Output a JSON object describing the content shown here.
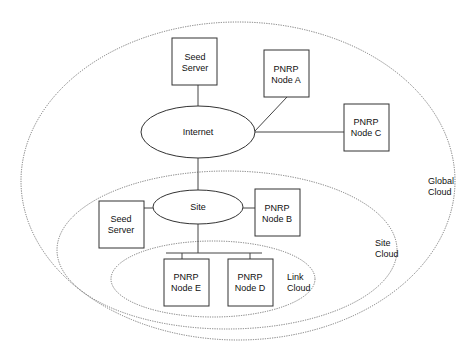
{
  "diagram": {
    "clouds": {
      "global": {
        "line1": "Global",
        "line2": "Cloud"
      },
      "site": {
        "line1": "Site",
        "line2": "Cloud"
      },
      "link": {
        "line1": "Link",
        "line2": "Cloud"
      }
    },
    "networks": {
      "internet": {
        "label": "Internet"
      },
      "site": {
        "label": "Site"
      }
    },
    "nodes": {
      "seed_server_global": {
        "line1": "Seed",
        "line2": "Server"
      },
      "pnrp_node_a": {
        "line1": "PNRP",
        "line2": "Node A"
      },
      "pnrp_node_c": {
        "line1": "PNRP",
        "line2": "Node C"
      },
      "seed_server_site": {
        "line1": "Seed",
        "line2": "Server"
      },
      "pnrp_node_b": {
        "line1": "PNRP",
        "line2": "Node B"
      },
      "pnrp_node_e": {
        "line1": "PNRP",
        "line2": "Node E"
      },
      "pnrp_node_d": {
        "line1": "PNRP",
        "line2": "Node D"
      }
    }
  }
}
